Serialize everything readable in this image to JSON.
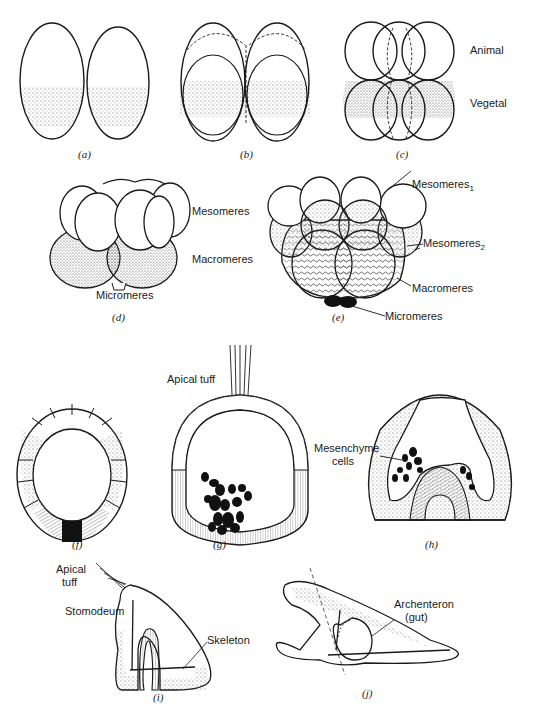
{
  "figure": {
    "panels": [
      {
        "id": "a",
        "caption": "(a)"
      },
      {
        "id": "b",
        "caption": "(b)"
      },
      {
        "id": "c",
        "caption": "(c)",
        "labels": {
          "animal": "Animal",
          "vegetal": "Vegetal"
        }
      },
      {
        "id": "d",
        "caption": "(d)",
        "labels": {
          "mesomeres": "Mesomeres",
          "macromeres": "Macromeres",
          "micromeres": "Micromeres"
        }
      },
      {
        "id": "e",
        "caption": "(e)",
        "labels": {
          "mesomeres1": "Mesomeres",
          "mesomeres1_sub": "1",
          "mesomeres2": "Mesomeres",
          "mesomeres2_sub": "2",
          "macromeres": "Macromeres",
          "micromeres": "Micromeres"
        }
      },
      {
        "id": "f",
        "caption": "(f)"
      },
      {
        "id": "g",
        "caption": "(g)",
        "labels": {
          "apical_tuff": "Apical tuff"
        }
      },
      {
        "id": "h",
        "caption": "(h)",
        "labels": {
          "mesenchyme_line1": "Mesenchyme",
          "mesenchyme_line2": "cells"
        }
      },
      {
        "id": "i",
        "caption": "(i)",
        "labels": {
          "apical_line1": "Apical",
          "apical_line2": "tuff",
          "stomodeum": "Stomodeum",
          "skeleton": "Skeleton"
        }
      },
      {
        "id": "j",
        "caption": "(j)",
        "labels": {
          "archenteron_line1": "Archenteron",
          "archenteron_line2": "(gut)"
        }
      }
    ]
  },
  "colors": {
    "ink": "#1a1a1a",
    "stipple": "#9a9a9a",
    "paper": "#ffffff"
  }
}
